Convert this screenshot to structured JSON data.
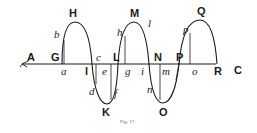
{
  "figure": {
    "caption": "Fig. 17.",
    "colors": {
      "ink": "#1a1a1a",
      "background": "#ffffff"
    }
  },
  "labels": {
    "A": "A",
    "G": "G",
    "a": "a",
    "b": "b",
    "H": "H",
    "l1": "l",
    "c": "c",
    "e": "e",
    "d": "d",
    "f": "f",
    "K": "K",
    "L": "L",
    "h": "h",
    "M": "M",
    "l2": "l",
    "g": "g",
    "i": "i",
    "N": "N",
    "m": "m",
    "n": "n",
    "O": "O",
    "P": "P",
    "p": "p",
    "Q": "Q",
    "o": "o",
    "R": "R",
    "C": "C"
  }
}
